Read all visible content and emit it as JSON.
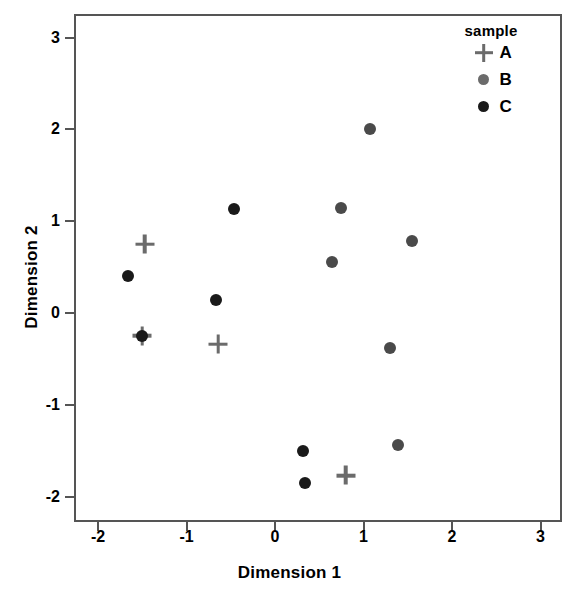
{
  "chart_data": {
    "type": "scatter",
    "title": "",
    "xlabel": "Dimension 1",
    "ylabel": "Dimension 2",
    "xlim": [
      -2.38,
      3.14
    ],
    "ylim": [
      -2.27,
      3.27
    ],
    "xticks": [
      -2,
      -1,
      0,
      1,
      2,
      3
    ],
    "xtick_labels": [
      "-2",
      "-1",
      "0",
      "1",
      "2",
      "3"
    ],
    "yticks": [
      -2,
      -1,
      0,
      1,
      2,
      3
    ],
    "ytick_labels": [
      "-2",
      "-1",
      "0",
      "1",
      "2",
      "3"
    ],
    "grid": false,
    "legend": {
      "title": "sample",
      "position": "top-right",
      "entries": [
        {
          "label": "A",
          "marker": "plus",
          "color": "#6b6b6b"
        },
        {
          "label": "B",
          "marker": "circle",
          "color": "#6b6b6b"
        },
        {
          "label": "C",
          "marker": "circle",
          "color": "#1a1a1a"
        }
      ]
    },
    "series": [
      {
        "name": "A",
        "marker": "plus",
        "color": "#6b6b6b",
        "points": [
          {
            "x": -1.47,
            "y": 0.75
          },
          {
            "x": -1.5,
            "y": -0.25
          },
          {
            "x": -0.64,
            "y": -0.34
          },
          {
            "x": 0.8,
            "y": -1.77
          }
        ]
      },
      {
        "name": "B",
        "marker": "circle",
        "color": "#4a4a4a",
        "points": [
          {
            "x": 1.07,
            "y": 2.0
          },
          {
            "x": 0.75,
            "y": 1.14
          },
          {
            "x": 1.55,
            "y": 0.78
          },
          {
            "x": 0.64,
            "y": 0.56
          },
          {
            "x": 1.3,
            "y": -0.38
          },
          {
            "x": 1.39,
            "y": -1.44
          }
        ]
      },
      {
        "name": "C",
        "marker": "circle",
        "color": "#1a1a1a",
        "points": [
          {
            "x": -0.46,
            "y": 1.13
          },
          {
            "x": -1.66,
            "y": 0.4
          },
          {
            "x": -0.67,
            "y": 0.14
          },
          {
            "x": -1.5,
            "y": -0.25
          },
          {
            "x": 0.32,
            "y": -1.5
          },
          {
            "x": 0.34,
            "y": -1.85
          }
        ]
      }
    ]
  },
  "style": {
    "axis_color": "#555555",
    "text_color": "#000000",
    "background": "#ffffff",
    "marker_size_circle": 12,
    "marker_size_plus": 19
  }
}
